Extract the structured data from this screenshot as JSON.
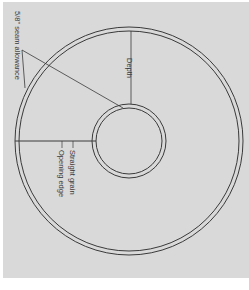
{
  "diagram": {
    "labels": {
      "seam_allowance": "5/8\" seam allowance",
      "depth": "Depth",
      "straight_grain": "Straight grain",
      "opening_edge": "Opening edge"
    },
    "colors": {
      "background": "#d9d9d9",
      "line": "#3a3a3a"
    }
  }
}
